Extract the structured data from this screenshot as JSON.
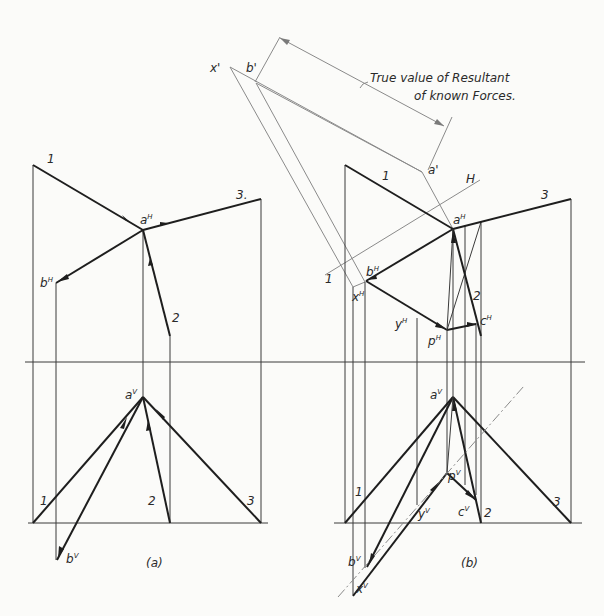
{
  "figure": {
    "annotation": {
      "line1": "True value of Resultant",
      "line2": "of known Forces."
    },
    "panel_a": {
      "caption": "(a)",
      "labels": {
        "force1_top": "1",
        "force3_top": "3.",
        "force2_top": "2",
        "a_h": "a",
        "a_h_sup": "H",
        "b_h": "b",
        "b_h_sup": "H",
        "a_v": "a",
        "a_v_sup": "V",
        "b_v": "b",
        "b_v_sup": "V",
        "force1_bottom": "1",
        "force2_bottom": "2",
        "force3_bottom": "3"
      }
    },
    "panel_b": {
      "caption": "(b)",
      "labels": {
        "x_prime": "x'",
        "b_prime": "b'",
        "a_prime": "a'",
        "ref_H": "H",
        "ref_1": "1",
        "force1_top": "1",
        "force3_top": "3",
        "force2_top": "2",
        "a_h": "a",
        "a_h_sup": "H",
        "b_h": "b",
        "b_h_sup": "H",
        "x_h": "x",
        "x_h_sup": "H",
        "y_h": "y",
        "y_h_sup": "H",
        "p_h": "p",
        "p_h_sup": "H",
        "c_h": "c",
        "c_h_sup": "H",
        "a_v": "a",
        "a_v_sup": "V",
        "p_v": "p",
        "p_v_sup": "V",
        "y_v": "y",
        "y_v_sup": "V",
        "c_v": "c",
        "c_v_sup": "V",
        "b_v": "b",
        "b_v_sup": "V",
        "x_v": "x",
        "x_v_sup": "V",
        "force1_bottom": "1",
        "force2_bottom": "2",
        "force3_bottom": "3"
      }
    },
    "colors": {
      "ink": "#1e1e1e",
      "construction": "#8a8a8a",
      "paper": "#fbfbf9"
    }
  }
}
